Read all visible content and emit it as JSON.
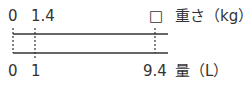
{
  "diagram": {
    "type": "double-number-line",
    "top_line": {
      "label": "重さ（kg）",
      "ticks": [
        "0",
        "1.4",
        "□"
      ]
    },
    "bottom_line": {
      "label": "量（L）",
      "ticks": [
        "0",
        "1",
        "9.4"
      ]
    },
    "line_color": "#333333"
  }
}
